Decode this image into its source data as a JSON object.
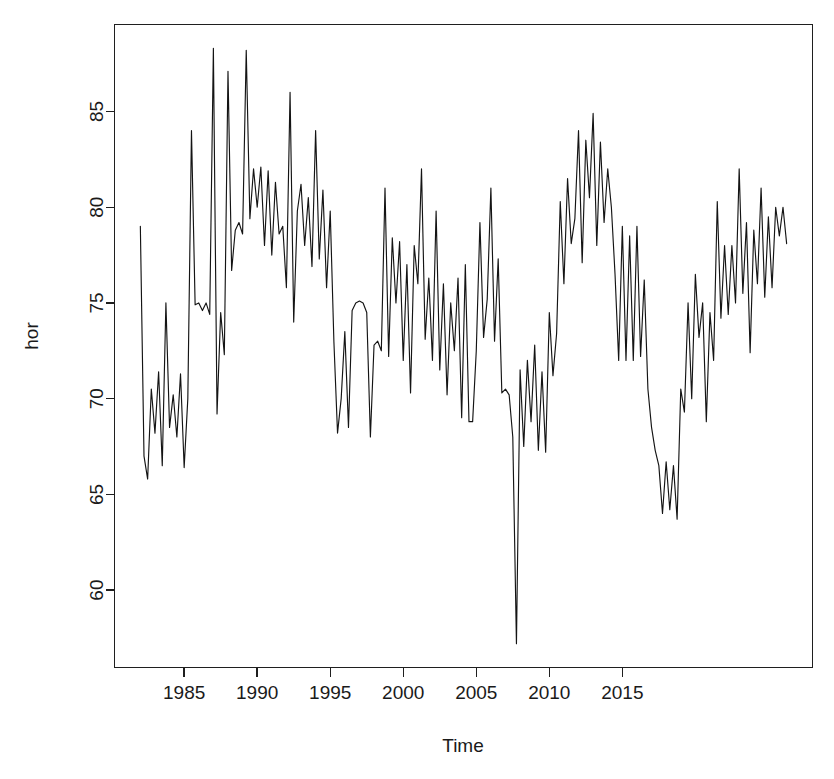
{
  "chart_data": {
    "type": "line",
    "title": "",
    "xlabel": "Time",
    "ylabel": "hor",
    "xlim": [
      1981.6,
      1981.6
    ],
    "ylim": [
      56.6,
      89.3
    ],
    "xticks": [
      1985,
      1990,
      1995,
      2000,
      2005,
      2010,
      2015
    ],
    "xtick_labels": [
      "1985",
      "1990",
      "1995",
      "2000",
      "2005",
      "2010",
      "2015"
    ],
    "yticks": [
      60,
      65,
      70,
      75,
      80,
      85
    ],
    "ytick_labels": [
      "60",
      "65",
      "70",
      "75",
      "80",
      "85"
    ],
    "grid": false,
    "legend": "none",
    "frequency": "monthly",
    "x_start": 1982.0,
    "x_step": 0.25,
    "line_color": "#141414",
    "series": [
      {
        "name": "hor",
        "values": [
          79.0,
          67.0,
          65.8,
          70.5,
          68.2,
          71.4,
          66.5,
          75.0,
          68.5,
          70.2,
          68.0,
          71.3,
          66.4,
          70.0,
          84.0,
          74.9,
          75.0,
          74.6,
          75.0,
          74.4,
          88.3,
          69.2,
          74.5,
          72.3,
          87.1,
          76.7,
          78.8,
          79.2,
          78.6,
          88.2,
          79.4,
          82.0,
          80.0,
          82.1,
          78.0,
          81.9,
          77.5,
          81.3,
          78.6,
          79.0,
          75.8,
          86.0,
          74.0,
          79.8,
          81.2,
          78.0,
          80.5,
          76.9,
          84.0,
          77.3,
          80.9,
          75.8,
          79.8,
          73.0,
          68.2,
          70.0,
          73.5,
          68.5,
          74.6,
          75.0,
          75.1,
          75.0,
          74.5,
          68.0,
          72.8,
          73.0,
          72.5,
          81.0,
          72.2,
          78.4,
          75.0,
          78.2,
          72.0,
          77.0,
          70.3,
          78.0,
          76.0,
          82.0,
          73.1,
          76.3,
          72.0,
          79.8,
          71.5,
          76.0,
          70.2,
          75.0,
          72.5,
          76.3,
          69.0,
          77.0,
          68.8,
          68.8,
          72.5,
          79.2,
          73.2,
          75.2,
          81.0,
          73.0,
          77.3,
          70.3,
          70.5,
          70.2,
          68.0,
          57.2,
          71.5,
          67.5,
          72.0,
          68.8,
          72.8,
          67.3,
          71.4,
          67.2,
          74.5,
          71.2,
          73.4,
          80.3,
          76.0,
          81.5,
          78.1,
          79.4,
          84.0,
          77.1,
          83.5,
          80.5,
          84.9,
          78.0,
          83.4,
          79.2,
          82.0,
          80.0,
          76.5,
          72.0,
          79.0,
          72.0,
          78.5,
          72.0,
          79.0,
          72.2,
          76.2,
          70.5,
          68.5,
          67.3,
          66.5,
          64.0,
          66.7,
          64.2,
          66.5,
          63.7,
          70.5,
          69.3,
          75.0,
          70.0,
          76.5,
          73.2,
          75.0,
          68.8,
          74.5,
          72.0,
          80.3,
          74.2,
          78.0,
          74.4,
          78.0,
          75.0,
          82.0,
          75.5,
          79.2,
          72.4,
          78.8,
          76.0,
          81.0,
          75.3,
          79.5,
          75.8,
          80.0,
          78.5,
          80.0,
          78.1
        ]
      }
    ]
  },
  "axes": {
    "x_axis_title": "Time",
    "y_axis_title": "hor"
  }
}
